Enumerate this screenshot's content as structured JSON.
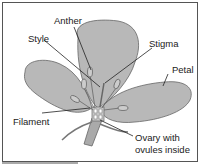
{
  "diagram": {
    "labels": {
      "anther": "Anther",
      "style": "Style",
      "stigma": "Stigma",
      "petal": "Petal",
      "filament": "Filament",
      "ovary_line1": "Ovary with",
      "ovary_line2": "ovules inside"
    },
    "colors": {
      "petal_fill": "#b8b8b8",
      "outline": "#555555",
      "leader_line": "#222222"
    }
  }
}
